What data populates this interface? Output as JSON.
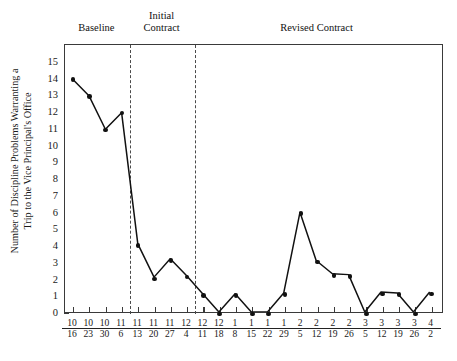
{
  "chart_data": {
    "type": "line",
    "title": "",
    "xlabel": "",
    "ylabel": "Number of Discipline Problems Warranting a\nTrip to the Vice Principal's Office",
    "ylim": [
      0,
      15
    ],
    "yticks": [
      0,
      1,
      2,
      3,
      4,
      5,
      6,
      7,
      8,
      9,
      10,
      11,
      12,
      13,
      14,
      15
    ],
    "grid": false,
    "legend": "none",
    "categories": [
      "10/16",
      "10/23",
      "10/30",
      "11/6",
      "11/13",
      "11/20",
      "11/27",
      "12/4",
      "12/11",
      "12/18",
      "1/8",
      "1/15",
      "1/22",
      "1/29",
      "2/5",
      "2/12",
      "2/19",
      "2/26",
      "3/5",
      "3/12",
      "3/19",
      "3/26",
      "4/2"
    ],
    "x_tick_numerators": [
      "10",
      "10",
      "10",
      "11",
      "11",
      "11",
      "11",
      "12",
      "12",
      "12",
      "1",
      "1",
      "1",
      "1",
      "2",
      "2",
      "2",
      "2",
      "3",
      "3",
      "3",
      "3",
      "4"
    ],
    "x_tick_denominators": [
      "16",
      "23",
      "30",
      "6",
      "13",
      "20",
      "27",
      "4",
      "11",
      "18",
      "8",
      "15",
      "22",
      "29",
      "5",
      "12",
      "19",
      "26",
      "5",
      "12",
      "19",
      "26",
      "2"
    ],
    "values": [
      14,
      13,
      11,
      12,
      4.1,
      2.1,
      3.2,
      2.2,
      1.1,
      0,
      1.1,
      0,
      0,
      1.15,
      6,
      3.1,
      2.3,
      2.25,
      0,
      1.2,
      1.15,
      0,
      1.2
    ],
    "series": [
      {
        "name": "discipline-referrals",
        "values": [
          14,
          13,
          11,
          12,
          4.1,
          2.1,
          3.2,
          2.2,
          1.1,
          0,
          1.1,
          0,
          0,
          1.15,
          6,
          3.1,
          2.3,
          2.25,
          0,
          1.2,
          1.15,
          0,
          1.2
        ]
      }
    ],
    "phases": [
      {
        "label": "Baseline",
        "start_index": 0,
        "end_index": 3
      },
      {
        "label": "Initial\nContract",
        "start_index": 4,
        "end_index": 7
      },
      {
        "label": "Revised Contract",
        "start_index": 8,
        "end_index": 22
      }
    ],
    "phase_lines_after_index": [
      3,
      7
    ],
    "line_color": "#111111",
    "marker_color": "#111111",
    "frame_color": "#3a3a3a",
    "phase_line_color": "#4a4a4a"
  }
}
